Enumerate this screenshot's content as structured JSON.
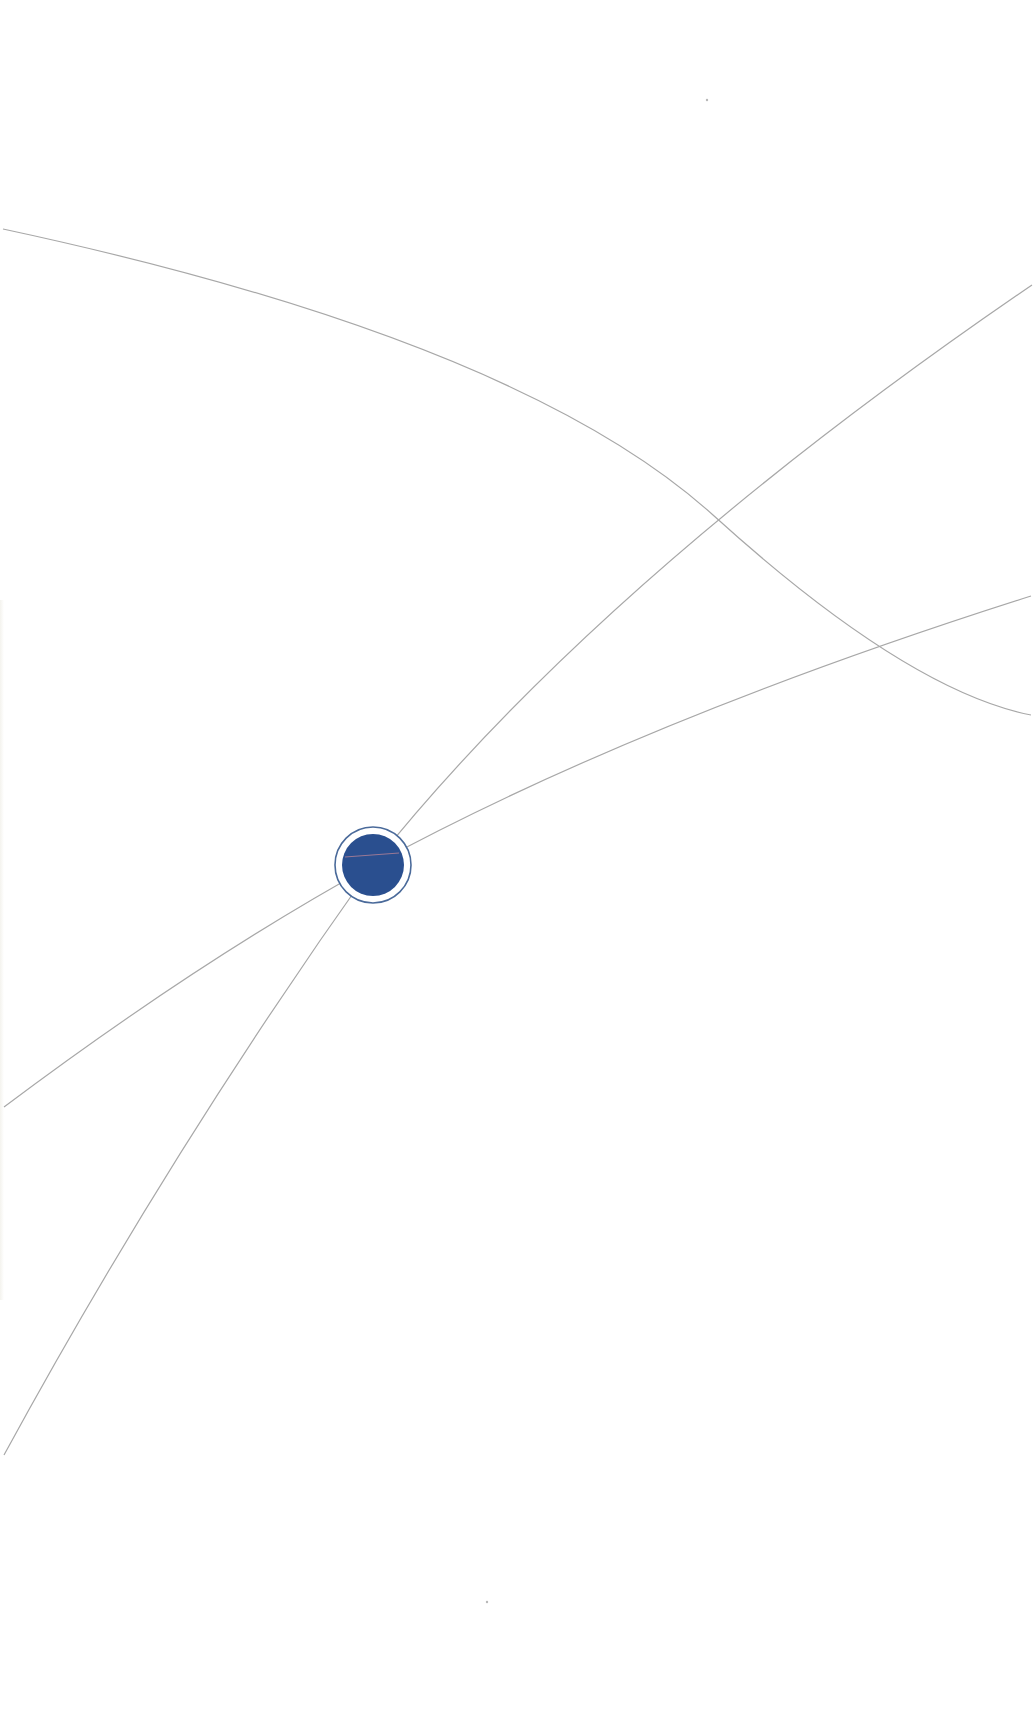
{
  "canvas": {
    "width": 1035,
    "height": 1728,
    "background": "#ffffff"
  },
  "style": {
    "line_color": "#a8a8a8",
    "line_width": 1.2,
    "node_fill": "#2a4f8f",
    "node_ring": "#4a6a9a",
    "inner_line_color": "#c98a98"
  },
  "node": {
    "cx": 373,
    "cy": 865,
    "r_fill": 31,
    "r_ring": 38
  },
  "curves": [
    {
      "name": "top-arc",
      "d": "M 3 229 Q 520 340 713 515 T 1031 715"
    },
    {
      "name": "steep-arc",
      "d": "M 4 1455 Q 170 1150 373 865 Q 600 580 1032 285"
    },
    {
      "name": "shallow-arc",
      "d": "M 4 1107 Q 200 960 373 865 Q 640 720 1031 596"
    }
  ],
  "specks": [
    {
      "x": 707,
      "y": 100
    },
    {
      "x": 487,
      "y": 1602
    }
  ]
}
